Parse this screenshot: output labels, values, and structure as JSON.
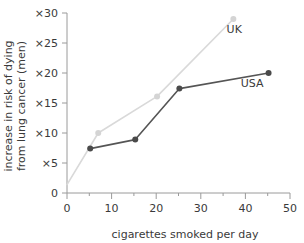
{
  "chart_data": {
    "type": "line",
    "title": "",
    "xlabel": "cigarettes smoked per day",
    "ylabel_line1": "increase in risk of dying",
    "ylabel_line2": "from lung cancer (men)",
    "xlim": [
      0,
      50
    ],
    "ylim": [
      0,
      30
    ],
    "xticks": [
      0,
      10,
      20,
      30,
      40,
      50
    ],
    "xtick_labels": [
      "0",
      "10",
      "20",
      "30",
      "40",
      "50"
    ],
    "xminor_ticks": [
      5,
      15,
      25,
      35,
      45
    ],
    "yticks": [
      0,
      5,
      10,
      15,
      20,
      25,
      30
    ],
    "ytick_labels": [
      "0",
      "×5",
      "×10",
      "×15",
      "×20",
      "×25",
      "×30"
    ],
    "grid": false,
    "legend_position": "inline-annotations",
    "series": [
      {
        "name": "UK",
        "color": "#d9d9d9",
        "marker_color": "#d4d4d4",
        "label_x": 37.5,
        "label_y": 26.6,
        "x": [
          0,
          7,
          20.2,
          37.3
        ],
        "y": [
          1.4,
          10.0,
          16.1,
          29.0
        ]
      },
      {
        "name": "USA",
        "color": "#555555",
        "marker_color": "#4a4a4a",
        "label_x": 41.5,
        "label_y": 17.6,
        "x": [
          5.2,
          15.3,
          25.2,
          45.2
        ],
        "y": [
          7.4,
          8.9,
          17.4,
          20.0
        ]
      }
    ]
  }
}
